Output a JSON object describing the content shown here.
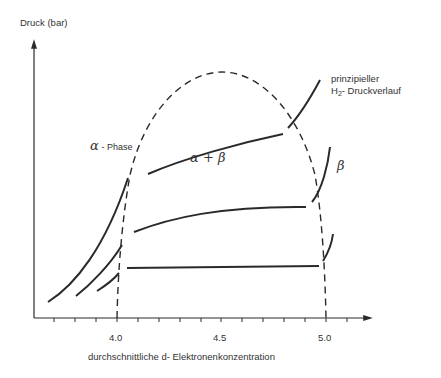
{
  "diagram": {
    "y_axis_label": "Druck (bar)",
    "x_axis_label": "durchschnittliche d- Elektronenkonzentration",
    "x_ticks": [
      {
        "label": "4.0",
        "value": 4.0
      },
      {
        "label": "4.5",
        "value": 4.5
      },
      {
        "label": "5.0",
        "value": 5.0
      }
    ],
    "annotation": {
      "line1": "prinzipieller",
      "line2_prefix": "H",
      "line2_sub": "2",
      "line2_suffix": "- Druckverlauf"
    },
    "regions": {
      "alpha": {
        "symbol": "α",
        "text": "- Phase"
      },
      "alpha_beta": "α + β",
      "beta": "β"
    },
    "colors": {
      "ink": "#2a2a2a",
      "background": "#ffffff"
    }
  }
}
